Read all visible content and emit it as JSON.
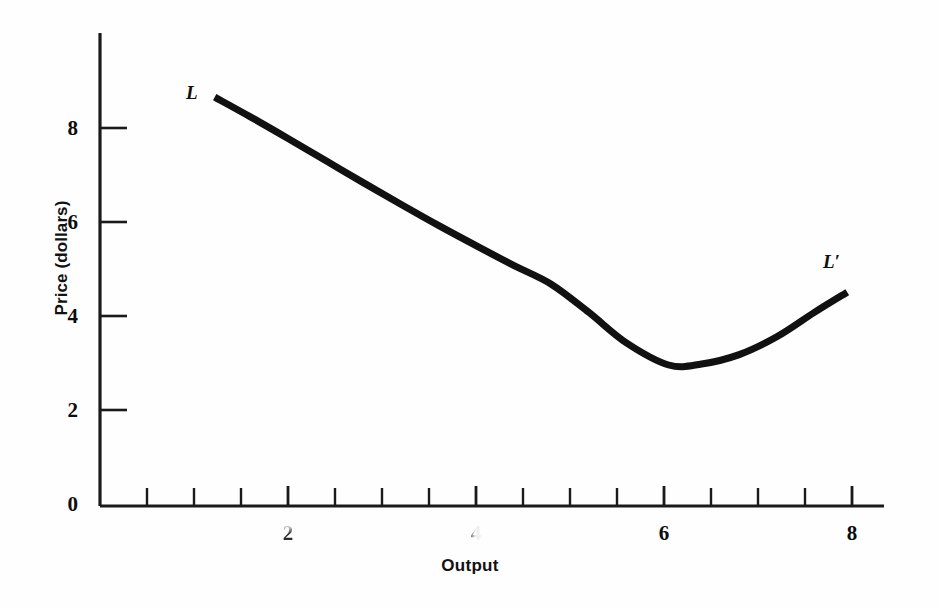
{
  "chart_data": {
    "type": "line",
    "title": "",
    "subtitle": "",
    "xlabel": "Output",
    "ylabel": "Price (dollars)",
    "xlim": [
      0,
      8.6
    ],
    "ylim": [
      0,
      9.6
    ],
    "grid": false,
    "legend_position": "inline-endpoint-labels",
    "x_ticks_major": [
      2,
      4,
      6,
      8
    ],
    "x_tick_labels": [
      "2",
      "4",
      "6",
      "8"
    ],
    "x_ticks_minor_step": 0.5,
    "y_ticks_major": [
      0,
      2,
      4,
      6,
      8
    ],
    "y_tick_labels": [
      "0",
      "2",
      "4",
      "6",
      "8"
    ],
    "annotations": [
      {
        "text": "L",
        "x": 1.0,
        "y": 9.0
      },
      {
        "text": "L′",
        "x": 8.3,
        "y": 5.3
      }
    ],
    "series": [
      {
        "name": "L",
        "label_start": "L",
        "label_end": "L′",
        "color": "#111111",
        "line_width": 7,
        "x": [
          1.22,
          1.6,
          2.0,
          2.4,
          2.8,
          3.2,
          3.6,
          4.0,
          4.4,
          4.8,
          5.2,
          5.6,
          6.05,
          6.4,
          6.8,
          7.2,
          7.6,
          7.95
        ],
        "y": [
          8.7,
          8.28,
          7.82,
          7.35,
          6.88,
          6.42,
          5.97,
          5.54,
          5.12,
          4.72,
          4.12,
          3.47,
          3.0,
          3.02,
          3.22,
          3.6,
          4.12,
          4.55
        ]
      }
    ]
  },
  "axis": {
    "ylabel": "Price (dollars)",
    "xlabel": "Output",
    "y_tick_labels": [
      "8",
      "6",
      "4",
      "2",
      "0"
    ],
    "x_tick_labels": [
      "2",
      "4",
      "6",
      "8"
    ]
  },
  "curve_labels": {
    "start": "L",
    "end": "L′"
  },
  "colors": {
    "ink": "#111111",
    "background": "#ffffff",
    "axis": "#1a1a1a"
  }
}
